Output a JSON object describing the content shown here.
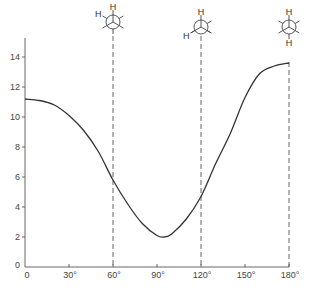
{
  "chart_data": {
    "type": "line",
    "title": "",
    "xlabel": "",
    "ylabel": "",
    "xlim": [
      0,
      180
    ],
    "ylim": [
      0,
      15
    ],
    "grid": false,
    "legend": null,
    "x_ticks": [
      0,
      30,
      60,
      90,
      120,
      150,
      180
    ],
    "x_tick_labels": [
      "0",
      "30°",
      "60°",
      "90°",
      "120°",
      "150°",
      "180°"
    ],
    "y_ticks": [
      0,
      2,
      4,
      6,
      8,
      10,
      12,
      14
    ],
    "y_tick_labels": [
      "0",
      "2",
      "4",
      "6",
      "8",
      "10",
      "12",
      "14"
    ],
    "series": [
      {
        "name": "coupling curve",
        "x": [
          0,
          10,
          20,
          30,
          40,
          50,
          60,
          70,
          80,
          90,
          95,
          100,
          110,
          120,
          130,
          140,
          150,
          160,
          170,
          180
        ],
        "values": [
          11.2,
          11.1,
          10.8,
          10.1,
          9.1,
          7.7,
          5.8,
          4.2,
          2.9,
          2.1,
          2.0,
          2.2,
          3.2,
          4.7,
          6.9,
          8.9,
          11.3,
          12.9,
          13.4,
          13.6
        ]
      }
    ],
    "annotations": [
      {
        "type": "dashed-vline",
        "x": 60,
        "label": "Newman projection (H–H dihedral 60°)"
      },
      {
        "type": "dashed-vline",
        "x": 120,
        "label": "Newman projection (H–H dihedral 120°)"
      },
      {
        "type": "dashed-vline",
        "x": 180,
        "label": "Newman projection (H–H dihedral 180°)"
      }
    ]
  },
  "newman": {
    "p60": {
      "front_h": "H",
      "back_h": "H"
    },
    "p120": {
      "front_h": "H",
      "back_h": "H"
    },
    "p180": {
      "front_h": "H",
      "back_h": "H"
    }
  }
}
